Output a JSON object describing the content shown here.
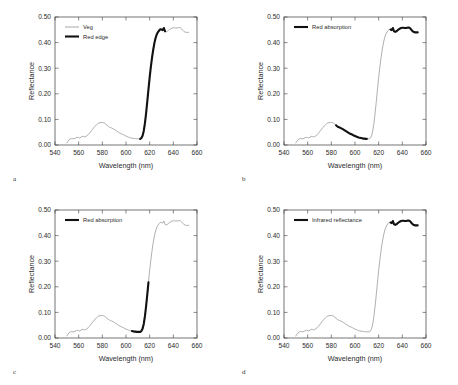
{
  "figure": {
    "letters": {
      "a": "a",
      "b": "b",
      "c": "c",
      "d": "d"
    },
    "colors": {
      "thin_line": "#8d8d8d",
      "bold_line": "#111111",
      "axis": "#3a3a3a",
      "background": "#ffffff"
    }
  },
  "chart_data": [
    {
      "type": "line",
      "panel": "a",
      "title": "",
      "xlabel": "Wavelength (nm)",
      "ylabel": "Reflectance",
      "xlim": [
        540,
        660
      ],
      "ylim": [
        0.0,
        0.5
      ],
      "xticks": [
        540,
        560,
        580,
        600,
        620,
        640,
        660
      ],
      "yticks": [
        "0.00",
        "0.10",
        "0.20",
        "0.30",
        "0.40",
        "0.50"
      ],
      "grid": false,
      "legend_position": "top-left",
      "legend": [
        {
          "label": "Veg",
          "style": "thin"
        },
        {
          "label": "Red edge",
          "style": "bold"
        }
      ],
      "highlight_range": [
        612,
        633
      ],
      "series": [
        {
          "name": "Veg",
          "style": "thin",
          "x": [
            550,
            551,
            552,
            553,
            554,
            555,
            556,
            557,
            558,
            559,
            560,
            561,
            562,
            563,
            564,
            565,
            566,
            567,
            568,
            569,
            570,
            571,
            572,
            573,
            574,
            575,
            576,
            577,
            578,
            579,
            580,
            581,
            582,
            583,
            584,
            585,
            586,
            587,
            588,
            589,
            590,
            591,
            592,
            593,
            594,
            595,
            596,
            597,
            598,
            599,
            600,
            601,
            602,
            603,
            604,
            605,
            606,
            607,
            608,
            609,
            610,
            611,
            612,
            613,
            614,
            615,
            616,
            617,
            618,
            619,
            620,
            621,
            622,
            623,
            624,
            625,
            626,
            627,
            628,
            629,
            630,
            631,
            632,
            633,
            634,
            635,
            636,
            637,
            638,
            639,
            640,
            641,
            642,
            643,
            644,
            645,
            646,
            647,
            648,
            649,
            650,
            651,
            652,
            653
          ],
          "y": [
            0.008,
            0.015,
            0.021,
            0.024,
            0.025,
            0.025,
            0.024,
            0.026,
            0.029,
            0.03,
            0.029,
            0.027,
            0.031,
            0.034,
            0.033,
            0.032,
            0.033,
            0.036,
            0.04,
            0.045,
            0.051,
            0.057,
            0.063,
            0.069,
            0.074,
            0.079,
            0.083,
            0.086,
            0.087,
            0.088,
            0.088,
            0.087,
            0.085,
            0.081,
            0.077,
            0.073,
            0.07,
            0.068,
            0.066,
            0.064,
            0.061,
            0.058,
            0.055,
            0.052,
            0.049,
            0.046,
            0.044,
            0.042,
            0.04,
            0.037,
            0.035,
            0.033,
            0.031,
            0.029,
            0.028,
            0.027,
            0.026,
            0.025,
            0.025,
            0.024,
            0.024,
            0.024,
            0.024,
            0.027,
            0.036,
            0.055,
            0.085,
            0.125,
            0.17,
            0.218,
            0.264,
            0.305,
            0.341,
            0.372,
            0.398,
            0.418,
            0.432,
            0.441,
            0.447,
            0.452,
            0.451,
            0.449,
            0.457,
            0.444,
            0.442,
            0.444,
            0.448,
            0.452,
            0.455,
            0.457,
            0.458,
            0.458,
            0.457,
            0.457,
            0.458,
            0.459,
            0.458,
            0.454,
            0.448,
            0.443,
            0.441,
            0.44,
            0.44,
            0.44
          ]
        }
      ]
    },
    {
      "type": "line",
      "panel": "b",
      "title": "",
      "xlabel": "Wavelength (nm)",
      "ylabel": "Reflectance",
      "xlim": [
        540,
        660
      ],
      "ylim": [
        0.0,
        0.5
      ],
      "xticks": [
        540,
        560,
        580,
        600,
        620,
        640,
        660
      ],
      "yticks": [
        "0.00",
        "0.10",
        "0.20",
        "0.30",
        "0.40",
        "0.50"
      ],
      "grid": false,
      "legend_position": "top-left",
      "legend": [
        {
          "label": "Red absorption",
          "style": "bold"
        }
      ],
      "highlight_ranges": [
        [
          584,
          610
        ],
        [
          630,
          653
        ]
      ]
    },
    {
      "type": "line",
      "panel": "c",
      "title": "",
      "xlabel": "Wavelength (nm)",
      "ylabel": "Reflectance",
      "xlim": [
        540,
        660
      ],
      "ylim": [
        0.0,
        0.5
      ],
      "xticks": [
        540,
        560,
        580,
        600,
        620,
        640,
        660
      ],
      "yticks": [
        "0.00",
        "0.10",
        "0.20",
        "0.30",
        "0.40",
        "0.50"
      ],
      "grid": false,
      "legend_position": "top-left",
      "legend": [
        {
          "label": "Red absorption",
          "style": "bold"
        }
      ],
      "highlight_range": [
        605,
        619
      ]
    },
    {
      "type": "line",
      "panel": "d",
      "title": "",
      "xlabel": "Wavelength (nm)",
      "ylabel": "Reflectance",
      "xlim": [
        540,
        660
      ],
      "ylim": [
        0.0,
        0.5
      ],
      "xticks": [
        540,
        560,
        580,
        600,
        620,
        640,
        660
      ],
      "yticks": [
        "0.00",
        "0.10",
        "0.20",
        "0.30",
        "0.40",
        "0.50"
      ],
      "grid": false,
      "legend_position": "top-left",
      "legend": [
        {
          "label": "Infrared reflectance",
          "style": "bold"
        }
      ],
      "highlight_range": [
        630,
        653
      ]
    }
  ]
}
